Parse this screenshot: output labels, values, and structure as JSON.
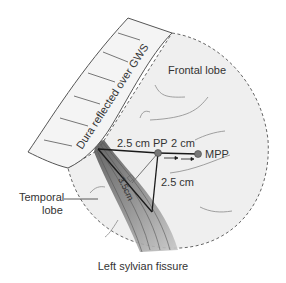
{
  "figure": {
    "caption": "Left sylvian fissure",
    "regions": {
      "frontal": "Frontal lobe",
      "temporal_line1": "Temporal",
      "temporal_line2": "lobe",
      "dura": "Dura reflected over GWS"
    },
    "points": {
      "pp": "PP",
      "mpp": "MPP"
    },
    "measurements": {
      "sylvian_to_pp": "2.5 cm",
      "pp_to_mpp": "2 cm",
      "pp_to_bottom": "2.5 cm",
      "diagonal": "3.5cm"
    },
    "colors": {
      "brain_fill": "#efefef",
      "dura_fill": "#f4f4f4",
      "outline": "#555555",
      "fissure": "#6a6a6a",
      "lines": "#1a1a1a",
      "point": "#777777"
    }
  }
}
